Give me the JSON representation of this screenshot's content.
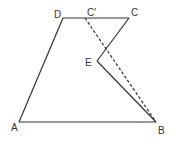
{
  "diagram": {
    "type": "geometry-figure",
    "colors": {
      "stroke": "#333333",
      "background": "#ffffff"
    },
    "points": {
      "A": {
        "label": "A",
        "x": 19,
        "y": 122,
        "lx": 11,
        "ly": 131
      },
      "B": {
        "label": "B",
        "x": 156,
        "y": 122,
        "lx": 158,
        "ly": 134
      },
      "C": {
        "label": "C",
        "x": 129,
        "y": 18,
        "lx": 131,
        "ly": 16
      },
      "D": {
        "label": "D",
        "x": 63,
        "y": 18,
        "lx": 54,
        "ly": 18
      },
      "E": {
        "label": "E",
        "x": 97,
        "y": 61,
        "lx": 85,
        "ly": 66
      },
      "C_prime": {
        "label": "C'",
        "x": 85,
        "y": 18,
        "lx": 87,
        "ly": 16
      }
    },
    "segments": [
      {
        "from": "A",
        "to": "B",
        "style": "solid"
      },
      {
        "from": "A",
        "to": "D",
        "style": "solid"
      },
      {
        "from": "D",
        "to": "C",
        "style": "solid"
      },
      {
        "from": "C",
        "to": "E",
        "style": "solid"
      },
      {
        "from": "E",
        "to": "B",
        "style": "solid"
      },
      {
        "from": "C_prime",
        "to": "B",
        "style": "dashed"
      }
    ]
  }
}
